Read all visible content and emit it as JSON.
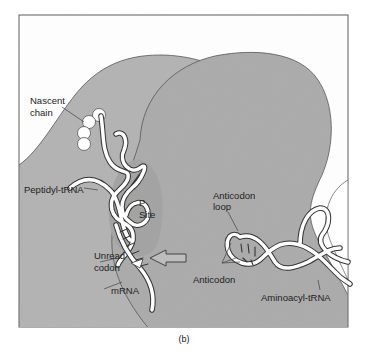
{
  "figure": {
    "caption": "(b)",
    "colors": {
      "background": "#ffffff",
      "frame": "#777777",
      "large_subunit": "#b3b3b3",
      "small_subunit": "#a8a8a8",
      "outline": "#555555",
      "strand_fill": "#ffffff",
      "strand_edge": "#333333",
      "label_text": "#222222"
    },
    "labels": {
      "nascent_chain_line1": "Nascent",
      "nascent_chain_line2": "chain",
      "peptidyl_trna": "Peptidyl-tRNA",
      "p_site_line1": "P",
      "p_site_line2": "Site",
      "unread_codon_line1": "Unread",
      "unread_codon_line2": "codon",
      "mrna": "mRNA",
      "anticodon_loop_line1": "Anticodon",
      "anticodon_loop_line2": "loop",
      "anticodon": "Anticodon",
      "aminoacyl_trna": "Aminoacyl-tRNA"
    },
    "components": [
      "ribosome-large-subunit",
      "ribosome-small-subunit",
      "nascent-chain",
      "peptidyl-trna",
      "p-site",
      "mrna",
      "unread-codon",
      "entry-arrow",
      "aminoacyl-trna",
      "anticodon-loop",
      "anticodon"
    ]
  }
}
